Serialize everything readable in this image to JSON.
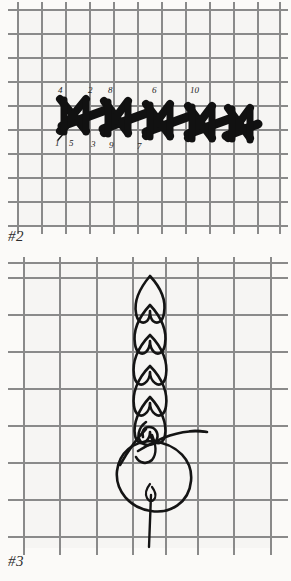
{
  "document": {
    "type": "embroidery-stitch-instruction-diagrams",
    "background_color": "#f6f5f3",
    "grid_color": "#8d8d8d",
    "ink_color": "#111111"
  },
  "panels": [
    {
      "id": "panel-2",
      "figure_label": "#2",
      "caption": "",
      "grid": {
        "cell_size": 24,
        "left": 18,
        "top": 10,
        "cols": 11,
        "rows": 9
      },
      "stitch": {
        "name": "cross-stitch-row",
        "count": 5,
        "style": "filled-black-crosses-on-diagonal-baseline"
      },
      "numbers": {
        "top_row": [
          "4",
          "2",
          "8",
          "6",
          "10"
        ],
        "bottom_row": [
          "1",
          "5",
          "3",
          "9",
          "7"
        ],
        "top_positions": [
          {
            "label": "4",
            "x": 58,
            "y": 86
          },
          {
            "label": "2",
            "x": 88,
            "y": 86
          },
          {
            "label": "8",
            "x": 108,
            "y": 86
          },
          {
            "label": "6",
            "x": 152,
            "y": 86
          },
          {
            "label": "10",
            "x": 192,
            "y": 86
          }
        ],
        "bottom_positions": [
          {
            "label": "1",
            "x": 56,
            "y": 138
          },
          {
            "label": "5",
            "x": 70,
            "y": 138
          },
          {
            "label": "3",
            "x": 91,
            "y": 139
          },
          {
            "label": "9",
            "x": 109,
            "y": 140
          },
          {
            "label": "7",
            "x": 137,
            "y": 141
          }
        ]
      }
    },
    {
      "id": "panel-3",
      "figure_label": "#3",
      "caption": "",
      "grid": {
        "cell_size": 36.5,
        "left": 24,
        "top": 263,
        "cols": 7,
        "rows": 8
      },
      "stitch": {
        "name": "braid-chain-stitch-with-needle",
        "chain_loops": 5,
        "elements": [
          "braid-column",
          "needle",
          "working-thread-loop",
          "thread-tail"
        ]
      }
    }
  ]
}
